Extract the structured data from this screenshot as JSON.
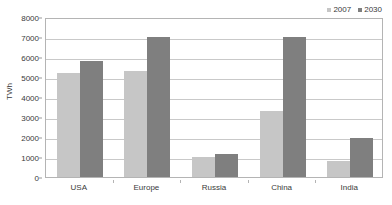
{
  "chart_data": {
    "type": "bar",
    "title": "",
    "subtitle": "",
    "xlabel": "",
    "ylabel": "TWh",
    "categories": [
      "USA",
      "Europe",
      "Russia",
      "China",
      "India"
    ],
    "series": [
      {
        "name": "2007",
        "color": "#c6c6c6",
        "values": [
          5200,
          5300,
          1000,
          3300,
          800
        ]
      },
      {
        "name": "2030",
        "color": "#7f7f7f",
        "values": [
          5800,
          7000,
          1150,
          7000,
          1950
        ]
      }
    ],
    "ylim": [
      0,
      8000
    ],
    "y_ticks": [
      0,
      1000,
      2000,
      3000,
      4000,
      5000,
      6000,
      7000,
      8000
    ],
    "y_tick_labels": [
      "0",
      "1000",
      "2000",
      "3000",
      "4000",
      "5000",
      "6000",
      "7000",
      "8000"
    ],
    "grid": true,
    "grid_axis": "y",
    "legend_position": "top-right",
    "legend_entries": [
      "2007",
      "2030"
    ],
    "plot_border": true,
    "background_color": "#ffffff",
    "axis_color": "#b4b4b4",
    "grid_color": "#c9c9c9",
    "text_color": "#3a3a3a"
  }
}
